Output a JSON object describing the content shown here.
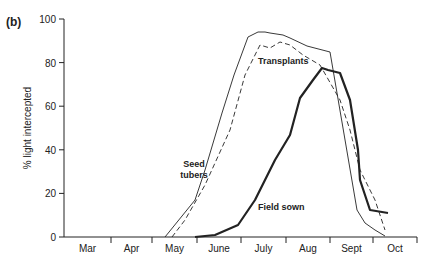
{
  "panel_label": "(b)",
  "chart_data": {
    "type": "line",
    "title": "",
    "xlabel": "",
    "ylabel": "% light intercepted",
    "ylim": [
      0,
      100
    ],
    "yticks": [
      0,
      20,
      40,
      60,
      80,
      100
    ],
    "categories": [
      "Mar",
      "Apr",
      "May",
      "June",
      "July",
      "Aug",
      "Sept",
      "Oct"
    ],
    "grid": false,
    "series": [
      {
        "name": "Seed tubers",
        "style": "thin solid",
        "points": [
          [
            165,
            237
          ],
          [
            195,
            200
          ],
          [
            205,
            170
          ],
          [
            222,
            113
          ],
          [
            234,
            75
          ],
          [
            248,
            37
          ],
          [
            258,
            32
          ],
          [
            265,
            32
          ],
          [
            270,
            33
          ],
          [
            283,
            35
          ],
          [
            290,
            38
          ],
          [
            307,
            46
          ],
          [
            330,
            52
          ],
          [
            357,
            210
          ],
          [
            365,
            223
          ],
          [
            375,
            230
          ],
          [
            385,
            236
          ]
        ]
      },
      {
        "name": "Transplants",
        "style": "dashed",
        "points": [
          [
            172,
            237
          ],
          [
            185,
            220
          ],
          [
            205,
            185
          ],
          [
            230,
            130
          ],
          [
            245,
            75
          ],
          [
            260,
            45
          ],
          [
            270,
            48
          ],
          [
            280,
            42
          ],
          [
            290,
            45
          ],
          [
            303,
            55
          ],
          [
            320,
            65
          ],
          [
            340,
            100
          ],
          [
            350,
            130
          ],
          [
            360,
            170
          ],
          [
            375,
            200
          ],
          [
            385,
            230
          ]
        ]
      },
      {
        "name": "Field sown",
        "style": "thick solid",
        "points": [
          [
            195,
            237
          ],
          [
            215,
            235
          ],
          [
            238,
            225
          ],
          [
            255,
            200
          ],
          [
            275,
            160
          ],
          [
            290,
            135
          ],
          [
            300,
            98
          ],
          [
            313,
            80
          ],
          [
            322,
            68
          ],
          [
            328,
            70
          ],
          [
            340,
            73
          ],
          [
            350,
            100
          ],
          [
            358,
            150
          ],
          [
            360,
            180
          ],
          [
            370,
            210
          ],
          [
            388,
            213
          ]
        ]
      }
    ],
    "annotations": [
      "Transplants",
      "Seed tubers",
      "Field sown"
    ]
  }
}
